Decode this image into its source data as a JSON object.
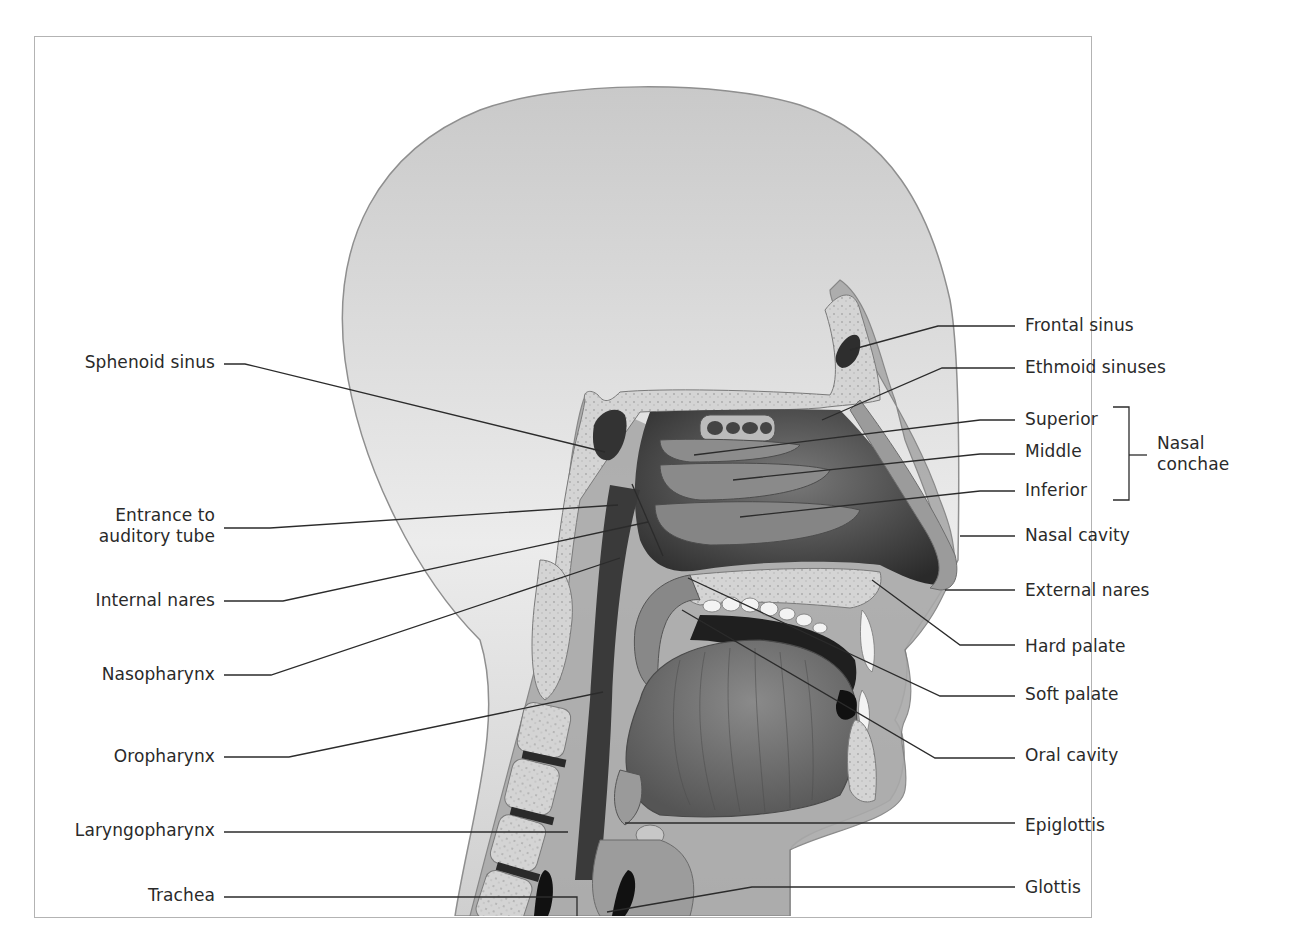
{
  "figure": {
    "frame_border_color": "#b3b3b3",
    "colors": {
      "skin": "#d6d6d6",
      "tissue": "#9a9a9a",
      "bone": "#cfcfcf",
      "cavity_dark": "#1e1e1e",
      "muscle": "#6f6f6f",
      "leader_line": "#2b2b2b",
      "label_text": "#2a2a2a"
    }
  },
  "labels_left": [
    {
      "id": "sphenoid-sinus",
      "text": "Sphenoid sinus"
    },
    {
      "id": "entrance-auditory-tube",
      "text": "Entrance to\nauditory tube"
    },
    {
      "id": "internal-nares",
      "text": "Internal nares"
    },
    {
      "id": "nasopharynx",
      "text": "Nasopharynx"
    },
    {
      "id": "oropharynx",
      "text": "Oropharynx"
    },
    {
      "id": "laryngopharynx",
      "text": "Laryngopharynx"
    },
    {
      "id": "trachea",
      "text": "Trachea"
    }
  ],
  "labels_right": [
    {
      "id": "frontal-sinus",
      "text": "Frontal sinus"
    },
    {
      "id": "ethmoid-sinuses",
      "text": "Ethmoid sinuses"
    },
    {
      "id": "superior",
      "text": "Superior"
    },
    {
      "id": "middle",
      "text": "Middle"
    },
    {
      "id": "inferior",
      "text": "Inferior"
    },
    {
      "id": "nasal-cavity",
      "text": "Nasal cavity"
    },
    {
      "id": "external-nares",
      "text": "External nares"
    },
    {
      "id": "hard-palate",
      "text": "Hard palate"
    },
    {
      "id": "soft-palate",
      "text": "Soft palate"
    },
    {
      "id": "oral-cavity",
      "text": "Oral cavity"
    },
    {
      "id": "epiglottis",
      "text": "Epiglottis"
    },
    {
      "id": "glottis",
      "text": "Glottis"
    }
  ],
  "group_label": {
    "id": "nasal-conchae",
    "text": "Nasal\nconchae",
    "members": [
      "Superior",
      "Middle",
      "Inferior"
    ]
  }
}
